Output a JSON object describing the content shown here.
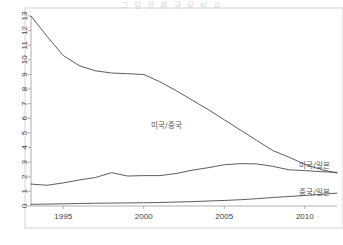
{
  "figure": {
    "title_faint": "그 림  경 제 규 모  비 교",
    "background": "#ffffff",
    "line_color": "#4a4a4a",
    "axis_color": "#9a9a9a",
    "border_color": "#c9c9cf"
  },
  "chart_data": {
    "type": "line",
    "title": "",
    "subtitle": "",
    "xlabel": "",
    "ylabel": "",
    "xlim": [
      1993,
      2012
    ],
    "ylim": [
      0,
      13
    ],
    "grid": false,
    "legend_position": "inline-labels",
    "xticks": [
      1995,
      2000,
      2005,
      2010
    ],
    "xtick_labels": [
      "1995",
      "2000",
      "2005",
      "2010"
    ],
    "yticks": [
      0,
      1,
      2,
      3,
      4,
      5,
      6,
      7,
      8,
      9,
      10,
      11,
      12,
      13
    ],
    "ytick_labels": [
      "0",
      "1",
      "2",
      "3",
      "4",
      "5",
      "6",
      "7",
      "8",
      "9",
      "10",
      "11",
      "12",
      "13"
    ],
    "x": [
      1993,
      1994,
      1995,
      1996,
      1997,
      1998,
      1999,
      2000,
      2001,
      2002,
      2003,
      2004,
      2005,
      2006,
      2007,
      2008,
      2009,
      2010,
      2011,
      2012
    ],
    "series": [
      {
        "name": "미국/중국",
        "label": "미국/중국",
        "label_x": 2001.4,
        "label_y": 5.35,
        "values": [
          13.0,
          11.6,
          10.3,
          9.6,
          9.25,
          9.1,
          9.05,
          9.0,
          8.5,
          7.9,
          7.25,
          6.6,
          5.9,
          5.2,
          4.5,
          3.8,
          3.35,
          2.85,
          2.5,
          2.25
        ]
      },
      {
        "name": "미국/일본",
        "label": "미국/일본",
        "label_x": 2010.6,
        "label_y": 2.62,
        "values": [
          1.5,
          1.42,
          1.58,
          1.78,
          1.95,
          2.28,
          2.05,
          2.08,
          2.08,
          2.22,
          2.45,
          2.62,
          2.82,
          2.9,
          2.88,
          2.72,
          2.48,
          2.42,
          2.35,
          2.3
        ]
      },
      {
        "name": "중국/일본",
        "label": "중국/일본",
        "label_x": 2010.6,
        "label_y": 0.72,
        "values": [
          0.12,
          0.13,
          0.15,
          0.17,
          0.19,
          0.2,
          0.21,
          0.22,
          0.24,
          0.27,
          0.3,
          0.34,
          0.38,
          0.43,
          0.5,
          0.58,
          0.65,
          0.72,
          0.8,
          0.88
        ]
      }
    ]
  }
}
